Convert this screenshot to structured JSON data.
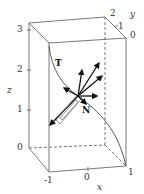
{
  "figure": {
    "type": "3d-space-curve-frenet-frame",
    "axes": {
      "x": {
        "name": "x",
        "ticks": [
          "-1",
          "0",
          "1"
        ]
      },
      "y": {
        "name": "y",
        "ticks": [
          "0",
          "1",
          "2"
        ]
      },
      "z": {
        "name": "z",
        "ticks": [
          "0",
          "1",
          "2",
          "3"
        ]
      }
    },
    "vectors": {
      "tangent": "T",
      "normal": "N"
    },
    "colors": {
      "box": "#555555",
      "curve": "#444444",
      "vectors": "#111111",
      "background": "#ffffff"
    }
  }
}
